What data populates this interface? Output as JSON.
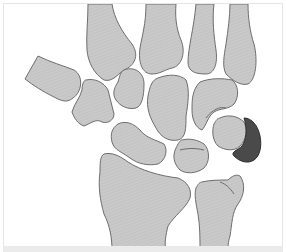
{
  "diagram": {
    "colors": {
      "background": "#ffffff",
      "frame_border": "#e6e6e6",
      "bottom_bar": "#ebebeb",
      "bone_fill": "#c8c8c8",
      "bone_stroke": "#6e6e6e",
      "highlight_fill": "#4a4a4a",
      "highlight_stroke": "#2e2e2e"
    },
    "bones": [
      {
        "id": "metacarpal-1",
        "label": ""
      },
      {
        "id": "metacarpal-2",
        "label": ""
      },
      {
        "id": "metacarpal-3",
        "label": ""
      },
      {
        "id": "metacarpal-4",
        "label": ""
      },
      {
        "id": "metacarpal-5",
        "label": ""
      },
      {
        "id": "trapezium",
        "label": ""
      },
      {
        "id": "trapezoid",
        "label": ""
      },
      {
        "id": "capitate",
        "label": ""
      },
      {
        "id": "hamate",
        "label": ""
      },
      {
        "id": "scaphoid",
        "label": ""
      },
      {
        "id": "lunate",
        "label": ""
      },
      {
        "id": "triquetrum",
        "label": ""
      },
      {
        "id": "pisiform",
        "label": "",
        "highlighted": true
      },
      {
        "id": "radius",
        "label": ""
      },
      {
        "id": "ulna",
        "label": ""
      }
    ]
  }
}
